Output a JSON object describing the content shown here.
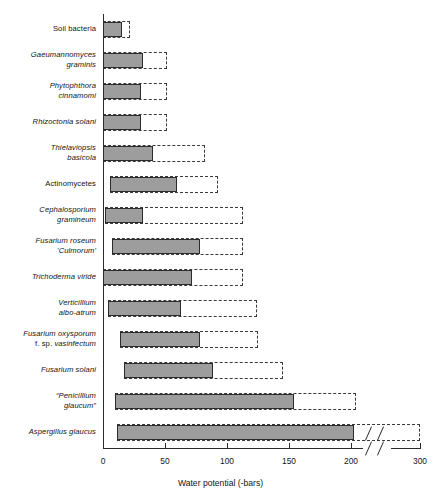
{
  "chart_data": {
    "type": "bar",
    "orientation": "horizontal",
    "title": "",
    "xlabel": "Water potential (-bars)",
    "ylabel": "",
    "xlim": [
      0,
      300
    ],
    "xticks": [
      0,
      50,
      100,
      150,
      200,
      300
    ],
    "xtick_labels": [
      "0",
      "50",
      "100",
      "150",
      "200",
      "300"
    ],
    "axis_break": {
      "after": 200,
      "before": 300,
      "style": "double-slash"
    },
    "grid": false,
    "legend": null,
    "categories": [
      "Soil bacteria",
      "Gaeumannomyces graminis",
      "Phytophthora cinnamomi",
      "Rhizoctonia solani",
      "Thielaviopsis basicola",
      "Actinomycetes",
      "Cephalosporium gramineum",
      "Fusarium roseum 'Culmorum'",
      "Trichoderma viride",
      "Verticillium albo-atrum",
      "Fusarium oxysporum f. sp. vasinfectum",
      "Fusarium solani",
      "\"Penicillium glaucum\"",
      "Aspergillus glaucus"
    ],
    "series": [
      {
        "name": "solid range",
        "style": "filled-grey",
        "intervals": [
          [
            0,
            15
          ],
          [
            0,
            32
          ],
          [
            0,
            31
          ],
          [
            0,
            31
          ],
          [
            0,
            40
          ],
          [
            6,
            60
          ],
          [
            2,
            32
          ],
          [
            7,
            78
          ],
          [
            0,
            72
          ],
          [
            4,
            63
          ],
          [
            14,
            78
          ],
          [
            17,
            89
          ],
          [
            10,
            154
          ],
          [
            11,
            205
          ]
        ]
      },
      {
        "name": "dashed range",
        "style": "dashed-outline",
        "intervals": [
          [
            0,
            22
          ],
          [
            0,
            52
          ],
          [
            0,
            52
          ],
          [
            0,
            52
          ],
          [
            0,
            82
          ],
          [
            6,
            93
          ],
          [
            2,
            113
          ],
          [
            7,
            113
          ],
          [
            0,
            113
          ],
          [
            4,
            124
          ],
          [
            14,
            125
          ],
          [
            17,
            145
          ],
          [
            10,
            207
          ],
          [
            11,
            300
          ]
        ]
      }
    ]
  },
  "labels": [
    {
      "lines": [
        {
          "text": "Soil bacteria",
          "italic": false
        }
      ]
    },
    {
      "lines": [
        {
          "text": "Gaeumannomyces",
          "italic": true
        },
        {
          "text": "graminis",
          "italic": true
        }
      ]
    },
    {
      "lines": [
        {
          "text": "Phytophthora",
          "italic": true
        },
        {
          "text": "cinnamomi",
          "italic": true
        }
      ]
    },
    {
      "lines": [
        {
          "text": "Rhizoctonia solani",
          "italic": true
        }
      ]
    },
    {
      "lines": [
        {
          "text": "Thielaviopsis",
          "italic": true
        },
        {
          "text": "basicola",
          "italic": true
        }
      ]
    },
    {
      "lines": [
        {
          "text": "Actinomycetes",
          "italic": false
        }
      ]
    },
    {
      "lines": [
        {
          "text": "Cephalosporium",
          "italic": true
        },
        {
          "text": "gramineum",
          "italic": true
        }
      ]
    },
    {
      "lines": [
        {
          "text": "Fusarium roseum",
          "italic": true
        },
        {
          "text": "'Culmorum'",
          "italic": true
        }
      ]
    },
    {
      "lines": [
        {
          "text": "Trichoderma viride",
          "italic": true
        }
      ]
    },
    {
      "lines": [
        {
          "text": "Verticillium",
          "italic": true
        },
        {
          "text": "albo-atrum",
          "italic": true
        }
      ]
    },
    {
      "lines": [
        {
          "text": "Fusarium oxysporum",
          "italic": true
        },
        {
          "text": "f. sp. vasinfectum",
          "italic": true,
          "roman_prefix": "f. sp. "
        }
      ]
    },
    {
      "lines": [
        {
          "text": "Fusarium solani",
          "italic": true
        }
      ]
    },
    {
      "lines": [
        {
          "text": "“Penicillium",
          "italic": true
        },
        {
          "text": "glaucum”",
          "italic": true
        }
      ]
    },
    {
      "lines": [
        {
          "text": "Aspergillus glaucus",
          "italic": true
        }
      ]
    }
  ],
  "colors": {
    "bar_fill": "#9d9d9d",
    "bar_stroke": "#2b2b2b",
    "dashed_stroke": "#3a3a3a",
    "axis": "#2b2b2b",
    "text": "#151515",
    "background": "#ffffff"
  }
}
